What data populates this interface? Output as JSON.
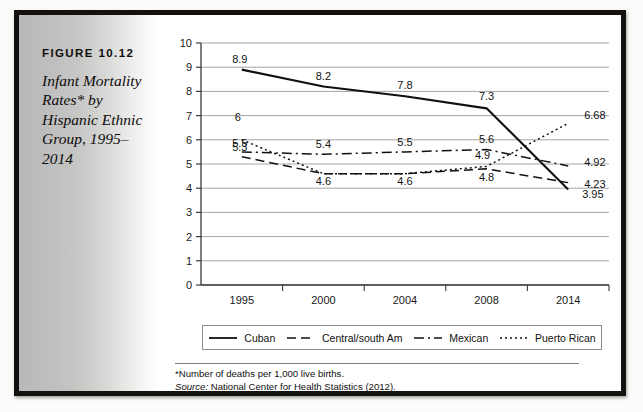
{
  "figure": {
    "label": "FIGURE 10.12",
    "caption": "Infant Mortality Rates* by Hispanic Ethnic Group, 1995–2014"
  },
  "footnote": {
    "line1": "*Number of deaths per 1,000 live births.",
    "source_word": "Source:",
    "source_text": " National Center for Health Statistics (2012)."
  },
  "legend": [
    {
      "label": "Cuban",
      "style": "solid"
    },
    {
      "label": "Central/south Am",
      "style": "dashed"
    },
    {
      "label": "Mexican",
      "style": "dash-dot"
    },
    {
      "label": "Puerto Rican",
      "style": "dotted"
    }
  ],
  "chart_data": {
    "type": "line",
    "title": "Infant Mortality Rates* by Hispanic Ethnic Group, 1995–2014",
    "xlabel": "",
    "ylabel": "",
    "categories": [
      "1995",
      "2000",
      "2004",
      "2008",
      "2014"
    ],
    "ylim": [
      0,
      10
    ],
    "yticks": [
      0,
      1,
      2,
      3,
      4,
      5,
      6,
      7,
      8,
      9,
      10
    ],
    "ytick_labels": [
      "0",
      "1",
      "2",
      "3",
      "4",
      "5",
      "6",
      "7",
      "8",
      "9",
      "10"
    ],
    "grid": true,
    "legend_position": "bottom",
    "series": [
      {
        "name": "Cuban",
        "style": "solid",
        "color": "#111111",
        "values": [
          8.9,
          8.2,
          7.8,
          7.3,
          3.95
        ],
        "labels": [
          "8.9",
          "8.2",
          "7.8",
          "7.3",
          "3.95"
        ]
      },
      {
        "name": "Central/south Am",
        "style": "dashed",
        "color": "#111111",
        "values": [
          5.3,
          4.6,
          4.6,
          4.8,
          4.23
        ],
        "labels": [
          "5.3",
          "4.6",
          "4.6",
          "4.8",
          "4.23"
        ]
      },
      {
        "name": "Mexican",
        "style": "dash-dot",
        "color": "#111111",
        "values": [
          5.5,
          5.4,
          5.5,
          5.6,
          4.92
        ],
        "labels": [
          "5.5",
          "5.4",
          "5.5",
          "5.6",
          "4.92"
        ]
      },
      {
        "name": "Puerto Rican",
        "style": "dotted",
        "color": "#111111",
        "values": [
          6.0,
          4.6,
          4.6,
          4.9,
          6.68
        ],
        "labels": [
          "6",
          "4.6",
          "4.6",
          "4.9",
          "6.68"
        ]
      }
    ]
  }
}
